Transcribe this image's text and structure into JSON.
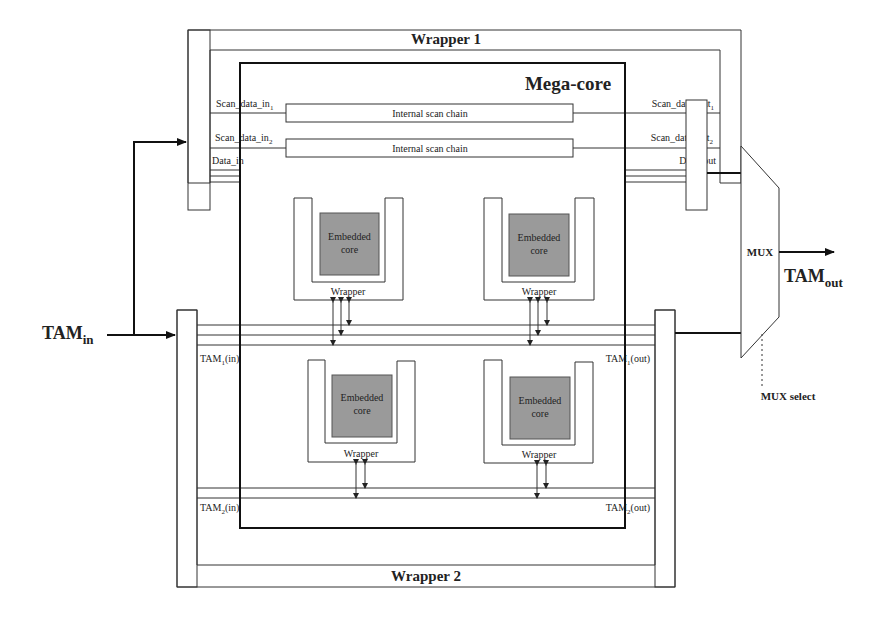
{
  "diagram": {
    "wrapper1": {
      "label": "Wrapper 1"
    },
    "wrapper2": {
      "label": "Wrapper 2"
    },
    "megacore": {
      "label": "Mega-core"
    },
    "scan_chains": [
      {
        "label": "Internal scan chain",
        "in_label": "Scan_data_in",
        "in_sub": "1",
        "out_label": "Scan_data_out",
        "out_sub": "1"
      },
      {
        "label": "Internal scan chain",
        "in_label": "Scan_data_in",
        "in_sub": "2",
        "out_label": "Scan_data_out",
        "out_sub": "2"
      }
    ],
    "data_in": "Data_in",
    "data_out": "Data_out",
    "embedded_cores": [
      {
        "label_line1": "Embedded",
        "label_line2": "core",
        "wrapper_label": "Wrapper"
      },
      {
        "label_line1": "Embedded",
        "label_line2": "core",
        "wrapper_label": "Wrapper"
      },
      {
        "label_line1": "Embedded",
        "label_line2": "core",
        "wrapper_label": "Wrapper"
      },
      {
        "label_line1": "Embedded",
        "label_line2": "core",
        "wrapper_label": "Wrapper"
      }
    ],
    "tam1_in": {
      "base": "TAM",
      "sub": "1",
      "suffix": "(in)"
    },
    "tam1_out": {
      "base": "TAM",
      "sub": "1",
      "suffix": "(out)"
    },
    "tam2_in": {
      "base": "TAM",
      "sub": "2",
      "suffix": "(in)"
    },
    "tam2_out": {
      "base": "TAM",
      "sub": "2",
      "suffix": "(out)"
    },
    "tam_in": {
      "base": "TAM",
      "sub": "in"
    },
    "tam_out": {
      "base": "TAM",
      "sub": "out"
    },
    "mux": {
      "label": "MUX",
      "select_label": "MUX select"
    }
  },
  "colors": {
    "line": "#333333",
    "core_fill": "#9a9a9a",
    "background": "#ffffff"
  }
}
